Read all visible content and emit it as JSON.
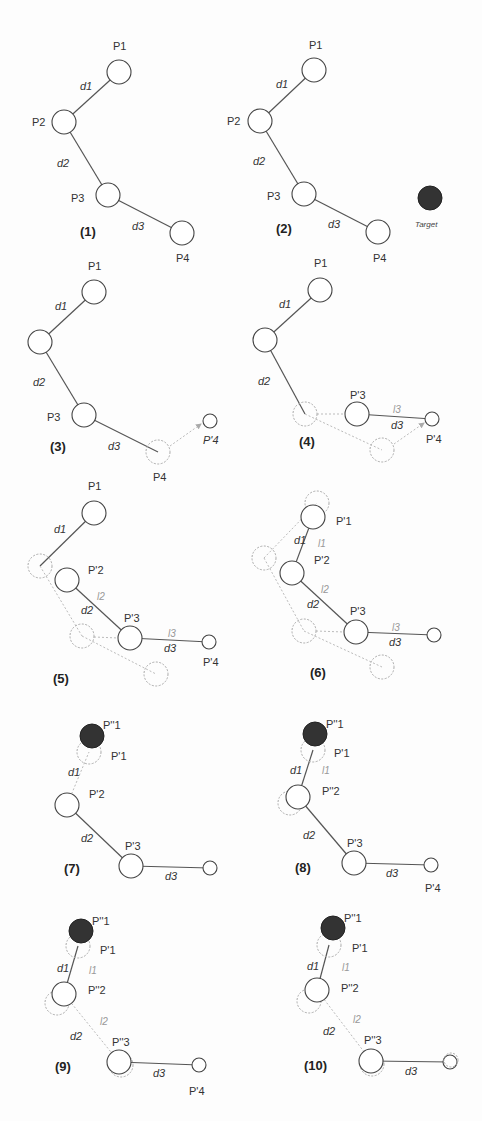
{
  "colors": {
    "joint_stroke": "#444444",
    "ghost_stroke": "#aaaaaa",
    "target_fill": "#333333",
    "background": "#fdfdfd"
  },
  "panels": [
    {
      "step": "(1)",
      "labels": {
        "p1": "P1",
        "p2": "P2",
        "p3": "P3",
        "p4": "P4",
        "d1": "d1",
        "d2": "d2",
        "d3": "d3"
      }
    },
    {
      "step": "(2)",
      "labels": {
        "p1": "P1",
        "p2": "P2",
        "p3": "P3",
        "p4": "P4",
        "d1": "d1",
        "d2": "d2",
        "d3": "d3",
        "target": "Target"
      }
    },
    {
      "step": "(3)",
      "labels": {
        "p1": "P1",
        "p3": "P3",
        "p4": "P4",
        "p4p": "P'4",
        "d1": "d1",
        "d2": "d2",
        "d3": "d3"
      }
    },
    {
      "step": "(4)",
      "labels": {
        "p1": "P1",
        "p3p": "P'3",
        "p4p": "P'4",
        "d1": "d1",
        "d2": "d2",
        "d3": "d3",
        "l3": "l3"
      }
    },
    {
      "step": "(5)",
      "labels": {
        "p1": "P1",
        "p2p": "P'2",
        "p3p": "P'3",
        "p4p": "P'4",
        "d1": "d1",
        "d2": "d2",
        "d3": "d3",
        "l2": "l2",
        "l3": "l3"
      }
    },
    {
      "step": "(6)",
      "labels": {
        "p1p": "P'1",
        "p2p": "P'2",
        "p3p": "P'3",
        "d1": "d1",
        "d2": "d2",
        "d3": "d3",
        "l1": "l1",
        "l2": "l2",
        "l3": "l3"
      }
    },
    {
      "step": "(7)",
      "labels": {
        "p1pp": "P''1",
        "p1p": "P'1",
        "p2p": "P'2",
        "p3p": "P'3",
        "d1": "d1",
        "d2": "d2",
        "d3": "d3"
      }
    },
    {
      "step": "(8)",
      "labels": {
        "p1pp": "P''1",
        "p1p": "P'1",
        "p2pp": "P''2",
        "p3p": "P'3",
        "p4p": "P'4",
        "d1": "d1",
        "d2": "d2",
        "d3": "d3",
        "l1": "l1"
      }
    },
    {
      "step": "(9)",
      "labels": {
        "p1pp": "P''1",
        "p1p": "P'1",
        "p2pp": "P''2",
        "p3pp": "P''3",
        "p4p": "P'4",
        "d1": "d1",
        "d2": "d2",
        "d3": "d3",
        "l1": "l1",
        "l2": "l2"
      }
    },
    {
      "step": "(10)",
      "labels": {
        "p1pp": "P''1",
        "p1p": "P'1",
        "p2pp": "P''2",
        "p3pp": "P''3",
        "d1": "d1",
        "d2": "d2",
        "d3": "d3",
        "l1": "l1",
        "l2": "l2"
      }
    }
  ]
}
